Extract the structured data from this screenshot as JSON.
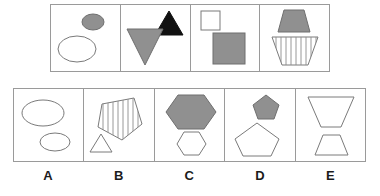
{
  "puzzle": {
    "type": "visual-analogy-matrix",
    "stroke_color": "#7a7a7a",
    "border_color": "#9a9a9a",
    "fill_gray": "#909090",
    "fill_black": "#111111",
    "fill_white": "#ffffff",
    "question_row": {
      "name": "question-sequence",
      "panels": [
        {
          "id": "panel-1",
          "label": "ellipse-pair",
          "shapes": [
            {
              "name": "small-gray-ellipse",
              "shape": "ellipse",
              "fill": "gray",
              "size": "small",
              "position": "top-right"
            },
            {
              "name": "large-white-ellipse",
              "shape": "ellipse",
              "fill": "white",
              "size": "large",
              "position": "bottom-left"
            }
          ]
        },
        {
          "id": "panel-2",
          "label": "triangle-pair",
          "shapes": [
            {
              "name": "small-black-triangle-up",
              "shape": "triangle",
              "fill": "black",
              "size": "small",
              "position": "top-right",
              "orientation": "up"
            },
            {
              "name": "large-gray-triangle-down",
              "shape": "triangle",
              "fill": "gray",
              "size": "large",
              "position": "bottom-left",
              "orientation": "down"
            }
          ]
        },
        {
          "id": "panel-3",
          "label": "square-pair",
          "shapes": [
            {
              "name": "small-white-square",
              "shape": "square",
              "fill": "white",
              "size": "small",
              "position": "top-left"
            },
            {
              "name": "large-gray-square",
              "shape": "square",
              "fill": "gray",
              "size": "large",
              "position": "bottom-right"
            }
          ]
        },
        {
          "id": "panel-4",
          "label": "trapezoid-pair",
          "shapes": [
            {
              "name": "small-gray-trapezoid",
              "shape": "trapezoid",
              "fill": "gray",
              "size": "small",
              "position": "top",
              "orientation": "up"
            },
            {
              "name": "large-striped-trapezoid",
              "shape": "trapezoid",
              "fill": "striped",
              "size": "large",
              "position": "bottom",
              "orientation": "down",
              "stripes": 10
            }
          ]
        }
      ]
    },
    "answer_row": {
      "name": "answer-options",
      "options": [
        {
          "letter": "A",
          "id": "option-a",
          "shapes": [
            {
              "name": "large-white-ellipse",
              "shape": "ellipse",
              "fill": "white",
              "size": "large",
              "position": "top-left"
            },
            {
              "name": "small-white-ellipse",
              "shape": "ellipse",
              "fill": "white",
              "size": "small",
              "position": "bottom-right"
            }
          ]
        },
        {
          "letter": "B",
          "id": "option-b",
          "shapes": [
            {
              "name": "large-striped-pentagon",
              "shape": "pentagon",
              "fill": "striped",
              "size": "large",
              "position": "top-right",
              "orientation": "down",
              "stripes": 8
            },
            {
              "name": "small-white-triangle",
              "shape": "triangle",
              "fill": "white",
              "size": "small",
              "position": "bottom-left",
              "orientation": "up"
            }
          ]
        },
        {
          "letter": "C",
          "id": "option-c",
          "shapes": [
            {
              "name": "large-gray-hexagon",
              "shape": "hexagon",
              "fill": "gray",
              "size": "large",
              "position": "top"
            },
            {
              "name": "small-white-hexagon",
              "shape": "hexagon",
              "fill": "white",
              "size": "small",
              "position": "bottom"
            }
          ]
        },
        {
          "letter": "D",
          "id": "option-d",
          "shapes": [
            {
              "name": "small-gray-pentagon",
              "shape": "pentagon",
              "fill": "gray",
              "size": "small",
              "position": "top-right"
            },
            {
              "name": "large-white-pentagon",
              "shape": "pentagon",
              "fill": "white",
              "size": "large",
              "position": "bottom-left"
            }
          ]
        },
        {
          "letter": "E",
          "id": "option-e",
          "shapes": [
            {
              "name": "large-white-trapezoid-down",
              "shape": "trapezoid",
              "fill": "white",
              "size": "large",
              "position": "top",
              "orientation": "down"
            },
            {
              "name": "small-white-trapezoid-up",
              "shape": "trapezoid",
              "fill": "white",
              "size": "small",
              "position": "bottom",
              "orientation": "up"
            }
          ]
        }
      ],
      "labels": [
        "A",
        "B",
        "C",
        "D",
        "E"
      ]
    }
  }
}
